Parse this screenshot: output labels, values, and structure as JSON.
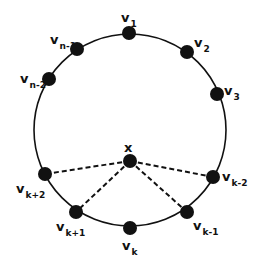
{
  "diagram": {
    "circle": {
      "cx": 130,
      "cy": 130,
      "r": 96,
      "stroke": "#111111"
    },
    "center_node": {
      "id": "x",
      "label": "x",
      "x": 130,
      "y": 161,
      "label_x": 124,
      "label_y": 152
    },
    "nodes": [
      {
        "id": "v1",
        "base": "v",
        "sub": "1",
        "x": 129,
        "y": 33,
        "lx": 121,
        "ly": 22
      },
      {
        "id": "v2",
        "base": "v",
        "sub": "2",
        "x": 187,
        "y": 52,
        "lx": 194,
        "ly": 47
      },
      {
        "id": "v3",
        "base": "v",
        "sub": "3",
        "x": 217,
        "y": 94,
        "lx": 224,
        "ly": 95
      },
      {
        "id": "vn-1",
        "base": "v",
        "sub": "n-1",
        "x": 77,
        "y": 49,
        "lx": 50,
        "ly": 44
      },
      {
        "id": "vn-2",
        "base": "v",
        "sub": "n-2",
        "x": 49,
        "y": 79,
        "lx": 20,
        "ly": 83
      },
      {
        "id": "vk-2",
        "base": "v",
        "sub": "k-2",
        "x": 213,
        "y": 177,
        "lx": 222,
        "ly": 181
      },
      {
        "id": "vk-1",
        "base": "v",
        "sub": "k-1",
        "x": 187,
        "y": 212,
        "lx": 193,
        "ly": 230
      },
      {
        "id": "vk",
        "base": "v",
        "sub": "k",
        "x": 130,
        "y": 228,
        "lx": 122,
        "ly": 250
      },
      {
        "id": "vk+1",
        "base": "v",
        "sub": "k+1",
        "x": 76,
        "y": 212,
        "lx": 56,
        "ly": 231
      },
      {
        "id": "vk+2",
        "base": "v",
        "sub": "k+2",
        "x": 45,
        "y": 174,
        "lx": 16,
        "ly": 193
      }
    ],
    "dashed_edges": [
      {
        "from": "x",
        "to": "vk+2"
      },
      {
        "from": "x",
        "to": "vk+1"
      },
      {
        "from": "x",
        "to": "vk-1"
      },
      {
        "from": "x",
        "to": "vk-2"
      }
    ],
    "node_radius": 7,
    "node_color": "#111111"
  }
}
